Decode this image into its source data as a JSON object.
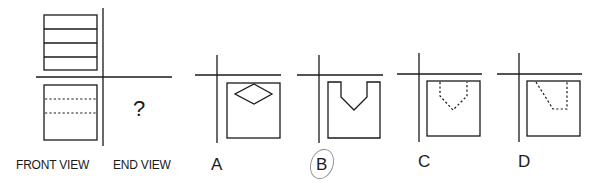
{
  "question": {
    "front_view_label": "FRONT VIEW",
    "end_view_label": "END VIEW",
    "unknown_symbol": "?"
  },
  "options": [
    {
      "letter": "A",
      "shape": "square with diamond"
    },
    {
      "letter": "B",
      "shape": "square with V-notch cut"
    },
    {
      "letter": "C",
      "shape": "square with dashed hidden V-notch"
    },
    {
      "letter": "D",
      "shape": "square with dashed hidden slanted notch"
    }
  ],
  "selected_answer": "B",
  "colors": {
    "line": "#1a1a1a",
    "selection_circle": "#9a9a9a",
    "background": "#ffffff"
  }
}
